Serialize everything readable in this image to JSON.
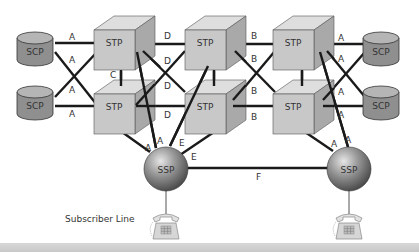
{
  "diagram": {
    "nodes": {
      "scp_tl": {
        "label": "SCP",
        "type": "database"
      },
      "scp_bl": {
        "label": "SCP",
        "type": "database"
      },
      "scp_tr": {
        "label": "SCP",
        "type": "database"
      },
      "scp_br": {
        "label": "SCP",
        "type": "database"
      },
      "stp_1t": {
        "label": "STP",
        "type": "cube"
      },
      "stp_1b": {
        "label": "STP",
        "type": "cube"
      },
      "stp_2t": {
        "label": "STP",
        "type": "cube"
      },
      "stp_2b": {
        "label": "STP",
        "type": "cube"
      },
      "stp_3t": {
        "label": "STP",
        "type": "cube"
      },
      "stp_3b": {
        "label": "STP",
        "type": "cube"
      },
      "ssp_l": {
        "label": "SSP",
        "type": "sphere"
      },
      "ssp_r": {
        "label": "SSP",
        "type": "sphere"
      },
      "phone_l": {
        "label": "",
        "type": "telephone"
      },
      "phone_r": {
        "label": "",
        "type": "telephone"
      }
    },
    "link_labels": {
      "scp_left": [
        "A",
        "A",
        "A",
        "A"
      ],
      "scp_right": [
        "A",
        "A",
        "A",
        "A"
      ],
      "c_link": "C",
      "d_links": [
        "D",
        "D",
        "D",
        "D"
      ],
      "b_links": [
        "B",
        "B",
        "B",
        "B"
      ],
      "ssp_left_a": [
        "A",
        "A"
      ],
      "ssp_left_e": [
        "E",
        "E"
      ],
      "ssp_right_a": [
        "A",
        "A"
      ],
      "f_link": "F"
    },
    "subscriber_line_label": "Subscriber Line",
    "colors": {
      "cube_front": "#c8c8c8",
      "cube_top": "#dedede",
      "cube_side": "#a9a9a9",
      "scp_body": "#8f8f8f",
      "scp_top": "#b5b5b5",
      "line": "#1a1a1a",
      "footer": "#cccccc"
    }
  }
}
